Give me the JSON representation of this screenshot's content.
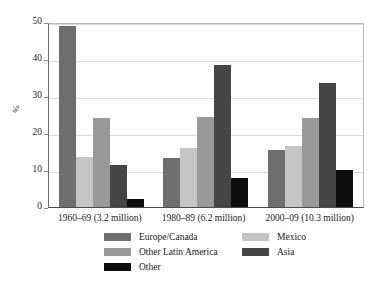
{
  "chart_data": {
    "type": "bar",
    "title": "",
    "subtitle": "",
    "xlabel": "",
    "ylabel": "%",
    "ylim": [
      0,
      50
    ],
    "yticks": [
      0,
      10,
      20,
      30,
      40,
      50
    ],
    "ytick_labels": [
      "0",
      "10",
      "20",
      "30",
      "40",
      "50"
    ],
    "grid": true,
    "grid_axis": "y",
    "legend_position": "bottom",
    "legend_columns": 2,
    "categories": [
      "1960–69 (3.2 million)",
      "1980–89 (6.2 million)",
      "2000–09 (10.3 million)"
    ],
    "series": [
      {
        "name": "Europe/Canada",
        "color": "#6e6e6e",
        "values": [
          49.0,
          13.2,
          15.3
        ]
      },
      {
        "name": "Mexico",
        "color": "#c5c5c5",
        "values": [
          13.5,
          16.0,
          16.4
        ]
      },
      {
        "name": "Other Latin America",
        "color": "#999999",
        "values": [
          24.1,
          24.4,
          24.0
        ]
      },
      {
        "name": "Asia",
        "color": "#454545",
        "values": [
          11.3,
          38.3,
          33.6
        ]
      },
      {
        "name": "Other",
        "color": "#0d0d0d",
        "values": [
          2.1,
          7.8,
          10.0
        ]
      }
    ],
    "legend_layout": [
      {
        "series_index": 0,
        "column": 0,
        "row": 0
      },
      {
        "series_index": 1,
        "column": 1,
        "row": 0
      },
      {
        "series_index": 2,
        "column": 0,
        "row": 1
      },
      {
        "series_index": 3,
        "column": 1,
        "row": 1
      },
      {
        "series_index": 4,
        "column": 0,
        "row": 2
      }
    ]
  },
  "style": {
    "background": "#ffffff",
    "gridline_color": "#dcdcdc",
    "axis_color": "#4a4a4a",
    "frame_color": "#b8b8b8",
    "text_color": "#1a1a1a"
  }
}
